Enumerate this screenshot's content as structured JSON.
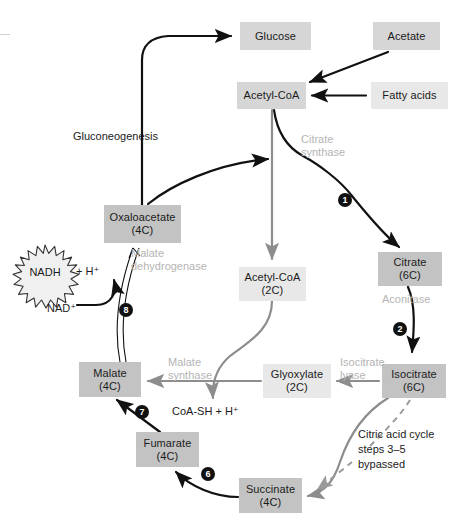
{
  "diagram": {
    "colors": {
      "box_dark": "#c3c3c3",
      "box_mid": "#d6d6d6",
      "box_light": "#e8e8e8",
      "text": "#1b1b1b",
      "enzyme_label": "#b4b4b4",
      "arrow_black": "#111111",
      "arrow_gray": "#8d8d8d",
      "dashed_gray": "#9a9a9a"
    }
  },
  "nodes": [
    {
      "id": "glucose",
      "name": "Glucose",
      "sub": "",
      "shade": "mid",
      "x": 240,
      "y": 22,
      "w": 71,
      "h": 28
    },
    {
      "id": "acetate",
      "name": "Acetate",
      "sub": "",
      "shade": "mid",
      "x": 373,
      "y": 22,
      "w": 67,
      "h": 28
    },
    {
      "id": "acetyl-coa-top",
      "name": "Acetyl-CoA",
      "sub": "",
      "shade": "mid",
      "x": 237,
      "y": 82,
      "w": 69,
      "h": 27
    },
    {
      "id": "fatty-acids",
      "name": "Fatty acids",
      "sub": "",
      "shade": "light",
      "x": 371,
      "y": 82,
      "w": 77,
      "h": 27
    },
    {
      "id": "oxaloacetate",
      "name": "Oxaloacetate",
      "sub": "(4C)",
      "shade": "dark",
      "x": 104,
      "y": 205,
      "w": 77,
      "h": 38
    },
    {
      "id": "acetyl-coa-2c",
      "name": "Acetyl-CoA",
      "sub": "(2C)",
      "shade": "light",
      "x": 239,
      "y": 267,
      "w": 67,
      "h": 34
    },
    {
      "id": "citrate",
      "name": "Citrate",
      "sub": "(6C)",
      "shade": "dark",
      "x": 378,
      "y": 252,
      "w": 64,
      "h": 34
    },
    {
      "id": "malate",
      "name": "Malate",
      "sub": "(4C)",
      "shade": "dark",
      "x": 79,
      "y": 362,
      "w": 62,
      "h": 35
    },
    {
      "id": "glyoxylate",
      "name": "Glyoxylate",
      "sub": "(2C)",
      "shade": "light",
      "x": 263,
      "y": 364,
      "w": 68,
      "h": 34
    },
    {
      "id": "isocitrate",
      "name": "Isocitrate",
      "sub": "(6C)",
      "shade": "dark",
      "x": 382,
      "y": 364,
      "w": 64,
      "h": 34
    },
    {
      "id": "fumarate",
      "name": "Fumarate",
      "sub": "(4C)",
      "shade": "dark",
      "x": 136,
      "y": 432,
      "w": 63,
      "h": 35
    },
    {
      "id": "succinate",
      "name": "Succinate",
      "sub": "(4C)",
      "shade": "dark",
      "x": 239,
      "y": 478,
      "w": 63,
      "h": 35
    }
  ],
  "enzyme_labels": [
    {
      "id": "citrate-synthase",
      "line1": "Citrate",
      "line2": "synthase",
      "x": 301,
      "y": 134
    },
    {
      "id": "malate-dehydrogenase",
      "line1": "Malate",
      "line2": "dehydrogenase",
      "x": 131,
      "y": 248
    },
    {
      "id": "aconitase",
      "line1": "Aconitase",
      "line2": "",
      "x": 382,
      "y": 298
    },
    {
      "id": "malate-synthase",
      "line1": "Malate",
      "line2": "synthase",
      "x": 168,
      "y": 357
    },
    {
      "id": "isocitrate-lyase",
      "line1": "Isocitrate",
      "line2": "lyase",
      "x": 340,
      "y": 357
    }
  ],
  "free_text": [
    {
      "id": "gluconeogenesis",
      "text": "Gluconeogenesis",
      "x": 73,
      "y": 130
    },
    {
      "id": "plus-h",
      "text": "+ H⁺",
      "x": 76,
      "y": 265
    },
    {
      "id": "nad-plus",
      "text": "NAD⁺",
      "x": 47,
      "y": 302
    },
    {
      "id": "coa-sh",
      "text": "CoA-SH + H⁺",
      "x": 172,
      "y": 406
    }
  ],
  "bypass_note": {
    "id": "bypass-note",
    "line1": "Citric acid cycle",
    "line2": "steps 3–5",
    "line3": "bypassed",
    "x": 358,
    "y": 428
  },
  "nadh": {
    "label": "NADH",
    "cx": 45,
    "cy": 272
  },
  "steps": [
    {
      "id": "step-1",
      "label": "1",
      "x": 345,
      "y": 194
    },
    {
      "id": "step-8",
      "label": "8",
      "x": 126,
      "y": 304
    },
    {
      "id": "step-2",
      "label": "2",
      "x": 400,
      "y": 323
    },
    {
      "id": "step-7",
      "label": "7",
      "x": 142,
      "y": 406
    },
    {
      "id": "step-6",
      "label": "6",
      "x": 208,
      "y": 468
    }
  ]
}
